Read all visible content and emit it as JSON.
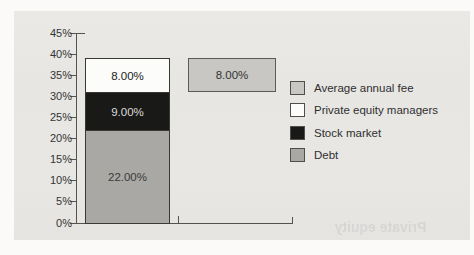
{
  "scan": {
    "page_background": "#fbfaf8",
    "panel_background": "#e8e7e4",
    "bleed_through_text": "Private equity"
  },
  "chart_data": {
    "type": "bar",
    "variant": "stacked column with floating comparison bar",
    "title": "",
    "xlabel": "",
    "ylabel": "",
    "ylim": [
      0,
      45
    ],
    "y_tick_step": 5,
    "y_ticks": [
      "0%",
      "5%",
      "10%",
      "15%",
      "20%",
      "25%",
      "30%",
      "35%",
      "40%",
      "45%"
    ],
    "grid": false,
    "axis_color": "#56534f",
    "text_color": "#343434",
    "categories": [
      "",
      ""
    ],
    "stacked_bar": {
      "total": 39,
      "segments": [
        {
          "name": "Debt",
          "value": 22,
          "label": "22.00%",
          "color": "#a9a8a5",
          "label_color": "#3a3a3a"
        },
        {
          "name": "Stock market",
          "value": 9,
          "label": "9.00%",
          "color": "#191918",
          "label_color": "#dcdcda"
        },
        {
          "name": "Private equity managers",
          "value": 8,
          "label": "8.00%",
          "color": "#fcfcfb",
          "label_color": "#222222"
        }
      ]
    },
    "floating_bar": {
      "name": "Average annual fee",
      "value": 8,
      "from": 31,
      "to": 39,
      "label": "8.00%",
      "color": "#c8c7c4",
      "label_color": "#333333"
    },
    "legend": {
      "position": "right",
      "items": [
        {
          "label": "Average annual fee",
          "color": "#c8c7c4"
        },
        {
          "label": "Private equity managers",
          "color": "#fcfcfb"
        },
        {
          "label": "Stock market",
          "color": "#191918"
        },
        {
          "label": "Debt",
          "color": "#a9a8a5"
        }
      ]
    }
  }
}
